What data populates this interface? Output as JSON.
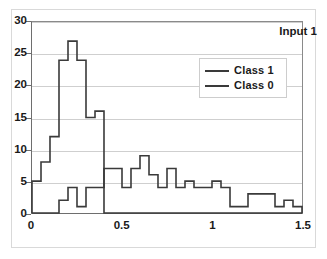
{
  "chart_data": {
    "type": "line",
    "subtype": "histogram-step-outline",
    "title": "Input 1",
    "xlabel": "",
    "ylabel": "",
    "xlim": [
      0,
      1.5
    ],
    "ylim": [
      0,
      30
    ],
    "xticks": [
      0,
      0.5,
      1,
      1.5
    ],
    "xtick_labels": [
      "0",
      "0.5",
      "1",
      "1.5"
    ],
    "yticks": [
      0,
      5,
      10,
      15,
      20,
      25,
      30
    ],
    "ytick_labels": [
      "0",
      "5",
      "10",
      "15",
      "20",
      "25",
      "30"
    ],
    "grid": "horizontal",
    "legend_position": "upper-right",
    "bin_width": 0.05,
    "bin_edges": [
      0.0,
      0.05,
      0.1,
      0.15,
      0.2,
      0.25,
      0.3,
      0.35,
      0.4,
      0.45,
      0.5,
      0.55,
      0.6,
      0.65,
      0.7,
      0.75,
      0.8,
      0.85,
      0.9,
      0.95,
      1.0,
      1.05,
      1.1,
      1.15,
      1.2,
      1.25,
      1.3,
      1.35,
      1.4,
      1.45,
      1.5
    ],
    "series": [
      {
        "name": "Class 1",
        "color": "#3a3a3a",
        "values": [
          5,
          8,
          12,
          24,
          27,
          24,
          15,
          16,
          0,
          0,
          0,
          0,
          0,
          0,
          0,
          0,
          0,
          0,
          0,
          0,
          0,
          0,
          0,
          0,
          0,
          0,
          0,
          0,
          0,
          0
        ]
      },
      {
        "name": "Class 0",
        "color": "#3a3a3a",
        "values": [
          0,
          0,
          0,
          2,
          4,
          1,
          4,
          4,
          7,
          7,
          4,
          7,
          9,
          6,
          4,
          7,
          4,
          5,
          4,
          4,
          5,
          4,
          1,
          1,
          3,
          3,
          3,
          1,
          2,
          1
        ]
      }
    ],
    "annotations": []
  },
  "legend": {
    "items": [
      {
        "label": "Class 1"
      },
      {
        "label": "Class 0"
      }
    ]
  }
}
